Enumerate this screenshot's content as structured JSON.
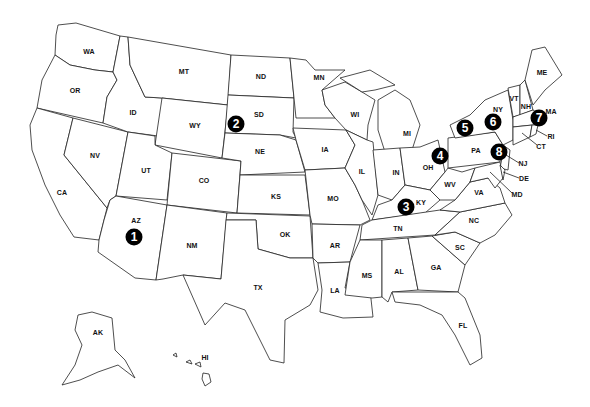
{
  "map": {
    "title": "United States map with numbered locations",
    "state_labels": [
      {
        "code": "WA",
        "x": 89,
        "y": 51
      },
      {
        "code": "OR",
        "x": 75,
        "y": 90
      },
      {
        "code": "CA",
        "x": 62,
        "y": 192
      },
      {
        "code": "NV",
        "x": 95,
        "y": 155
      },
      {
        "code": "ID",
        "x": 133,
        "y": 112
      },
      {
        "code": "MT",
        "x": 184,
        "y": 71
      },
      {
        "code": "WY",
        "x": 195,
        "y": 125
      },
      {
        "code": "UT",
        "x": 146,
        "y": 170
      },
      {
        "code": "CO",
        "x": 204,
        "y": 180
      },
      {
        "code": "AZ",
        "x": 136,
        "y": 220
      },
      {
        "code": "NM",
        "x": 192,
        "y": 245
      },
      {
        "code": "ND",
        "x": 261,
        "y": 76
      },
      {
        "code": "SD",
        "x": 259,
        "y": 114
      },
      {
        "code": "NE",
        "x": 260,
        "y": 151
      },
      {
        "code": "KS",
        "x": 276,
        "y": 196
      },
      {
        "code": "OK",
        "x": 285,
        "y": 234
      },
      {
        "code": "TX",
        "x": 258,
        "y": 287
      },
      {
        "code": "MN",
        "x": 319,
        "y": 77
      },
      {
        "code": "IA",
        "x": 325,
        "y": 149
      },
      {
        "code": "MO",
        "x": 333,
        "y": 198
      },
      {
        "code": "AR",
        "x": 335,
        "y": 245
      },
      {
        "code": "LA",
        "x": 335,
        "y": 290
      },
      {
        "code": "WI",
        "x": 355,
        "y": 114
      },
      {
        "code": "IL",
        "x": 362,
        "y": 171
      },
      {
        "code": "MI",
        "x": 407,
        "y": 133
      },
      {
        "code": "IN",
        "x": 396,
        "y": 172
      },
      {
        "code": "OH",
        "x": 428,
        "y": 167
      },
      {
        "code": "KY",
        "x": 421,
        "y": 202
      },
      {
        "code": "TN",
        "x": 398,
        "y": 228
      },
      {
        "code": "MS",
        "x": 367,
        "y": 275
      },
      {
        "code": "AL",
        "x": 399,
        "y": 271
      },
      {
        "code": "GA",
        "x": 436,
        "y": 267
      },
      {
        "code": "FL",
        "x": 463,
        "y": 325
      },
      {
        "code": "SC",
        "x": 460,
        "y": 247
      },
      {
        "code": "NC",
        "x": 474,
        "y": 220
      },
      {
        "code": "VA",
        "x": 479,
        "y": 192
      },
      {
        "code": "WV",
        "x": 450,
        "y": 184
      },
      {
        "code": "PA",
        "x": 476,
        "y": 150
      },
      {
        "code": "NY",
        "x": 498,
        "y": 109
      },
      {
        "code": "VT",
        "x": 514,
        "y": 98
      },
      {
        "code": "NH",
        "x": 526,
        "y": 106
      },
      {
        "code": "ME",
        "x": 542,
        "y": 72
      },
      {
        "code": "MA",
        "x": 551,
        "y": 111
      },
      {
        "code": "RI",
        "x": 551,
        "y": 136
      },
      {
        "code": "CT",
        "x": 541,
        "y": 146
      },
      {
        "code": "NJ",
        "x": 523,
        "y": 163
      },
      {
        "code": "DE",
        "x": 524,
        "y": 178
      },
      {
        "code": "MD",
        "x": 517,
        "y": 194
      },
      {
        "code": "AK",
        "x": 98,
        "y": 332
      },
      {
        "code": "HI",
        "x": 205,
        "y": 357
      }
    ],
    "markers": [
      {
        "number": "1",
        "x": 134,
        "y": 237,
        "state": "AZ"
      },
      {
        "number": "2",
        "x": 236,
        "y": 124,
        "state": "SD"
      },
      {
        "number": "3",
        "x": 406,
        "y": 207,
        "state": "KY"
      },
      {
        "number": "4",
        "x": 440,
        "y": 156,
        "state": "OH"
      },
      {
        "number": "5",
        "x": 465,
        "y": 128,
        "state": "NY"
      },
      {
        "number": "6",
        "x": 493,
        "y": 122,
        "state": "NY"
      },
      {
        "number": "7",
        "x": 539,
        "y": 118,
        "state": "MA"
      },
      {
        "number": "8",
        "x": 499,
        "y": 152,
        "state": "PA"
      }
    ],
    "colors": {
      "background": "#ffffff",
      "outline": "#222222",
      "marker_fill": "#000000",
      "marker_text": "#ffffff",
      "label_text": "#111111"
    }
  }
}
